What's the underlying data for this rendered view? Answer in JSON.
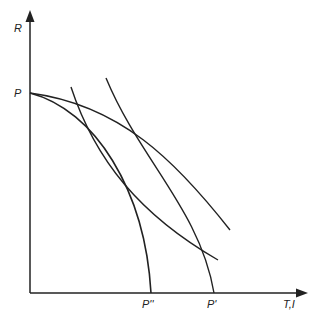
{
  "axes": {
    "y_label": "R",
    "x_label": "T,I"
  },
  "points": {
    "origin_y_intercept": "P",
    "inner_x_intercept": "P''",
    "outer_x_intercept": "P'"
  },
  "curves": [
    {
      "name": "inner-frontier",
      "from": "P",
      "to": "P''",
      "shape": "concave"
    },
    {
      "name": "outer-frontier",
      "from": "P",
      "to": "P'",
      "shape": "concave"
    },
    {
      "name": "steep-curve-left",
      "shape": "convex"
    },
    {
      "name": "steep-curve-right",
      "shape": "convex"
    }
  ],
  "colors": {
    "line": "#222222"
  }
}
